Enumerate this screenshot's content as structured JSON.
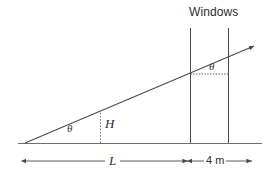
{
  "figure": {
    "type": "geometry-diagram",
    "background_color": "#ffffff",
    "line_color": "#4a4a4a",
    "text_color": "#2e2e2e",
    "width": 275,
    "height": 174,
    "labels": {
      "windows": "Windows",
      "theta_lower": "θ",
      "theta_upper": "θ",
      "height": "H",
      "length": "L",
      "gap": "4 m"
    },
    "dimensions": {
      "length_label": "L",
      "gap_label": "4 m",
      "height_label": "H"
    }
  }
}
